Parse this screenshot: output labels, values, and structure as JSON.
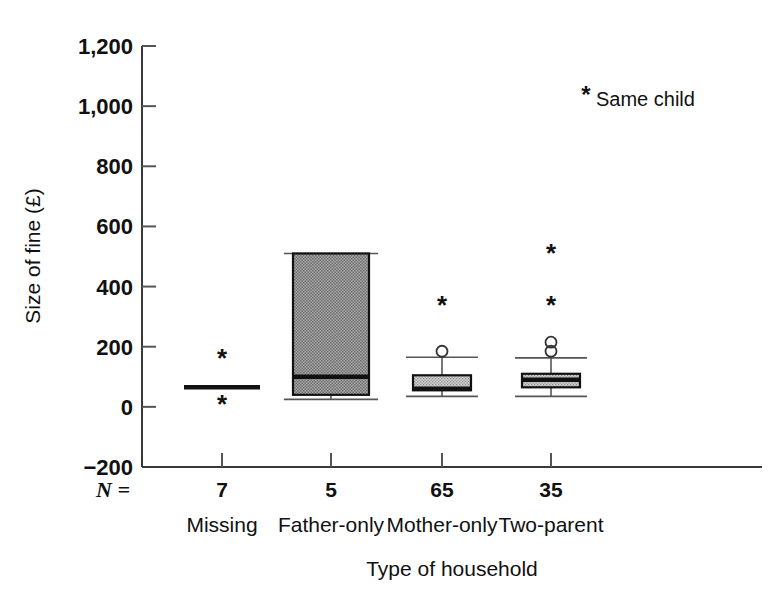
{
  "chart_data": {
    "type": "box",
    "title": "",
    "xlabel": "Type of household",
    "ylabel": "Size of fine (£)",
    "ylim": [
      -200,
      1200
    ],
    "ytick_labels": [
      "1,200",
      "1,000",
      "800",
      "600",
      "400",
      "200",
      "0",
      "−200"
    ],
    "ytick_values": [
      1200,
      1000,
      800,
      600,
      400,
      200,
      0,
      -200
    ],
    "grid": false,
    "legend_position": "top-right",
    "legend_entries": [
      {
        "marker": "*",
        "label": "Same child"
      }
    ],
    "n_row_label": "N =",
    "categories": [
      "Missing",
      "Father-only",
      "Mother-only",
      "Two-parent"
    ],
    "n_values": [
      "7",
      "5",
      "65",
      "35"
    ],
    "boxes": [
      {
        "category": "Missing",
        "n": "7",
        "q1": 65,
        "median": 65,
        "q3": 65,
        "whisker_low": 65,
        "whisker_high": 65,
        "collapsed": true,
        "outlier_circles": [],
        "outlier_stars": [
          163,
          10
        ]
      },
      {
        "category": "Father-only",
        "n": "5",
        "q1": 40,
        "median": 100,
        "q3": 510,
        "whisker_low": 25,
        "whisker_high": 510,
        "collapsed": false,
        "outlier_circles": [],
        "outlier_stars": []
      },
      {
        "category": "Mother-only",
        "n": "65",
        "q1": 55,
        "median": 60,
        "q3": 105,
        "whisker_low": 35,
        "whisker_high": 165,
        "collapsed": false,
        "outlier_circles": [
          185
        ],
        "outlier_stars": [
          340
        ]
      },
      {
        "category": "Two-parent",
        "n": "35",
        "q1": 65,
        "median": 90,
        "q3": 110,
        "whisker_low": 35,
        "whisker_high": 163,
        "collapsed": false,
        "outlier_circles": [
          215,
          185
        ],
        "outlier_stars": [
          510,
          340
        ]
      }
    ],
    "colors": {
      "box_fill": "#969696",
      "box_fill_light": "#b4b4b4",
      "axis": "#3a3a3a",
      "text": "#111111",
      "background": "#ffffff"
    }
  }
}
